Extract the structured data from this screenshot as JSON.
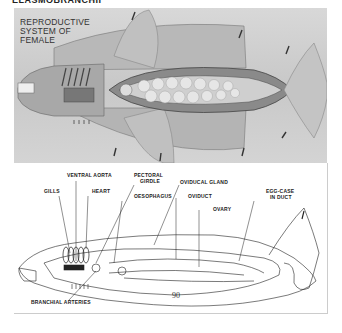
{
  "page": {
    "header_text": "ELASMOBRANCHII",
    "page_number": "90"
  },
  "photo": {
    "title_line1": "REPRODUCTIVE",
    "title_line2": "SYSTEM OF",
    "title_line3": "FEMALE"
  },
  "diagram": {
    "labels": {
      "ventral_aorta": "VENTRAL AORTA",
      "pectoral_girdle_1": "PECTORAL",
      "pectoral_girdle_2": "GIRDLE",
      "gills": "GILLS",
      "heart": "HEART",
      "oesophagus": "OESOPHAGUS",
      "oviducal_gland": "OVIDUCAL GLAND",
      "oviduct": "OVIDUCT",
      "ovary": "OVARY",
      "egg_case_1": "EGG-CASE",
      "egg_case_2": "IN DUCT",
      "branchial_arteries": "BRANCHIAL ARTERIES"
    }
  }
}
